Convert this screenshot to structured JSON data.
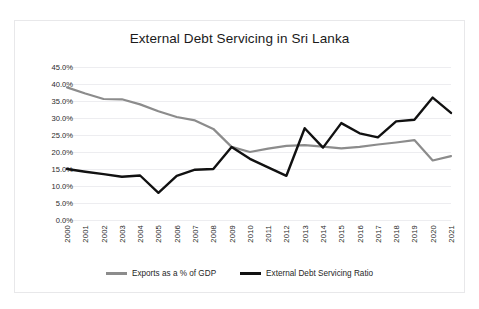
{
  "scan": {
    "top_artifact_text": "",
    "bottom_artifact_text": ""
  },
  "chart_data": {
    "type": "line",
    "title": "External Debt Servicing in Sri Lanka",
    "xlabel": "",
    "ylabel": "",
    "ylim": [
      0,
      45
    ],
    "ytick_step": 5,
    "grid": true,
    "legend_position": "bottom",
    "ytick_labels": [
      "45.0%",
      "40.0%",
      "35.0%",
      "30.0%",
      "25.0%",
      "20.0%",
      "15.0%",
      "10.0%",
      "5.0%",
      "0.0%"
    ],
    "ytick_values": [
      45,
      40,
      35,
      30,
      25,
      20,
      15,
      10,
      5,
      0
    ],
    "categories": [
      "2000",
      "2001",
      "2002",
      "2003",
      "2004",
      "2005",
      "2006",
      "2007",
      "2008",
      "2009",
      "2010",
      "2011",
      "2012",
      "2013",
      "2014",
      "2015",
      "2016",
      "2017",
      "2018",
      "2019",
      "2020",
      "2021"
    ],
    "series": [
      {
        "name": "Exports as a % of GDP",
        "color": "#8c8c8c",
        "values": [
          39.0,
          37.2,
          35.6,
          35.5,
          34.0,
          32.0,
          30.3,
          29.3,
          26.8,
          21.5,
          20.0,
          21.0,
          21.8,
          22.0,
          21.6,
          21.1,
          21.5,
          22.2,
          22.8,
          23.5,
          17.5,
          18.8
        ]
      },
      {
        "name": "External Debt Servicing Ratio",
        "color": "#111111",
        "values": [
          15.0,
          14.2,
          13.5,
          12.7,
          13.1,
          8.0,
          13.0,
          14.8,
          15.0,
          21.5,
          18.0,
          15.5,
          13.0,
          27.0,
          21.3,
          28.5,
          25.5,
          24.3,
          29.0,
          29.5,
          36.0,
          31.5
        ]
      }
    ],
    "legend": [
      {
        "label": "Exports as a % of GDP",
        "color": "#8c8c8c"
      },
      {
        "label": "External Debt Servicing Ratio",
        "color": "#111111"
      }
    ]
  }
}
